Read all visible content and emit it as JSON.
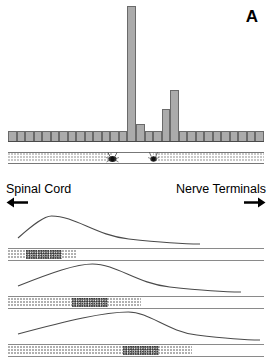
{
  "figure": {
    "panels": [
      {
        "id": "A",
        "label": "A"
      },
      {
        "id": "B",
        "label": "B"
      }
    ]
  },
  "direction": {
    "left_label": "Spinal Cord",
    "left_arrow_icon": "arrow-left-icon",
    "right_label": "Nerve Terminals",
    "right_arrow_icon": "arrow-right-icon"
  },
  "colors": {
    "bar_fill": "#ababab",
    "bar_stroke": "#6a6a6a",
    "trace_stroke": "#4a4a4a",
    "band_stipple": "#8f8f8f",
    "cluster_stipple": "#3a3a3a",
    "background": "#ffffff",
    "text": "#000000"
  },
  "panel_a": {
    "label": "A",
    "band": {
      "name": "axon-band",
      "markers": [
        {
          "name": "mite-marker-1",
          "x_percent": 40.5
        },
        {
          "name": "mite-marker-2",
          "x_percent": 56.5
        }
      ]
    }
  },
  "panel_b": {
    "label": "B",
    "traces": [
      {
        "name": "trace-1",
        "peak_x_percent": 17,
        "band_length_percent": 27,
        "cluster_center_percent": 14
      },
      {
        "name": "trace-2",
        "peak_x_percent": 33,
        "band_length_percent": 52,
        "cluster_center_percent": 32
      },
      {
        "name": "trace-3",
        "peak_x_percent": 47,
        "band_length_percent": 72,
        "cluster_center_percent": 52
      }
    ]
  },
  "chart_data": {
    "type": "bar",
    "title": "",
    "subtitle": "",
    "xlabel": "Position along axon (Spinal Cord → Nerve Terminals)",
    "ylabel": "",
    "grid": false,
    "legend": null,
    "axis_ranges": {
      "ylim": [
        0,
        100
      ]
    },
    "categories": [
      "1",
      "2",
      "3",
      "4",
      "5",
      "6",
      "7",
      "8",
      "9",
      "10",
      "11",
      "12",
      "13",
      "14",
      "15",
      "16",
      "17",
      "18",
      "19",
      "20",
      "21",
      "22",
      "23",
      "24",
      "25",
      "26",
      "27",
      "28",
      "29",
      "30"
    ],
    "values": [
      8,
      8,
      8,
      8,
      8,
      8,
      8,
      8,
      8,
      8,
      8,
      8,
      8,
      8,
      100,
      13,
      8,
      8,
      24,
      38,
      8,
      8,
      8,
      8,
      8,
      8,
      8,
      8,
      8,
      8
    ],
    "annotations": [
      {
        "text": "A",
        "position": "top-right"
      },
      {
        "text": "Spinal Cord",
        "position": "below-left"
      },
      {
        "text": "Nerve Terminals",
        "position": "below-right"
      }
    ]
  }
}
